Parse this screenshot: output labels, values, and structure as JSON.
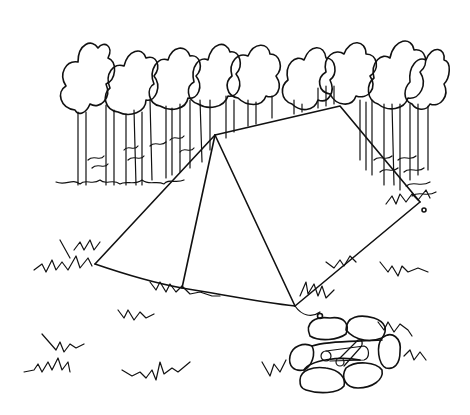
{
  "scene": {
    "description": "Black and white line drawing of a camping tent in front of a row of trees with grass tufts and a stone fire pit with logs",
    "ink_color": "#111111",
    "background_color": "#ffffff",
    "elements": [
      "tree-row",
      "tent",
      "grass-tufts",
      "fire-pit",
      "logs"
    ]
  }
}
